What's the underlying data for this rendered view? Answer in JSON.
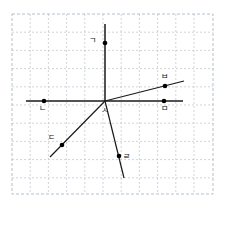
{
  "figure": {
    "background_color": "#ffffff",
    "grid": {
      "show": true,
      "border_color": "#9fb0c0",
      "line_color": "#b9c4cf",
      "style": "dashed",
      "x_start": 12,
      "y_start": 14,
      "x_end": 213,
      "y_end": 194,
      "spacing": 18.2,
      "columns": 11,
      "rows": 10
    },
    "origin": {
      "name": "origin",
      "x": 105,
      "y": 101
    },
    "axes": {
      "horizontal": {
        "name": "x-axis",
        "x1": 26,
        "y1": 101,
        "x2": 183,
        "y2": 101
      },
      "vertical": {
        "name": "y-axis",
        "x1": 105,
        "y1": 24,
        "x2": 105,
        "y2": 101
      }
    },
    "rays": [
      {
        "name": "ray-to-b",
        "x1": 105,
        "y1": 101,
        "x2": 184,
        "y2": 81
      },
      {
        "name": "ray-to-c",
        "x1": 105,
        "y1": 101,
        "x2": 50,
        "y2": 157
      },
      {
        "name": "ray-to-r",
        "x1": 105,
        "y1": 101,
        "x2": 124,
        "y2": 178
      }
    ],
    "points": [
      {
        "id": "g",
        "label": "ㄱ",
        "x": 105,
        "y": 43,
        "label_x": 96,
        "label_y": 43,
        "label_anchor": "end"
      },
      {
        "id": "n",
        "label": "ㄴ",
        "x": 44,
        "y": 101,
        "label_x": 39,
        "label_y": 111,
        "label_anchor": "start"
      },
      {
        "id": "d",
        "label": "ㄷ",
        "x": 62,
        "y": 145,
        "label_x": 55,
        "label_y": 140,
        "label_anchor": "end"
      },
      {
        "id": "r",
        "label": "ㄹ",
        "x": 119,
        "y": 156,
        "label_x": 123,
        "label_y": 159,
        "label_anchor": "start"
      },
      {
        "id": "m",
        "label": "ㅁ",
        "x": 164,
        "y": 101,
        "label_x": 164,
        "label_y": 111,
        "label_anchor": "middle"
      },
      {
        "id": "b",
        "label": "ㅂ",
        "x": 165,
        "y": 86,
        "label_x": 164,
        "label_y": 79,
        "label_anchor": "middle"
      },
      {
        "id": "s",
        "label": "ㅅ",
        "x": 105,
        "y": 101,
        "label_x": 104,
        "label_y": 113,
        "label_anchor": "middle"
      }
    ],
    "point_radius": 2.3,
    "colors": {
      "ink": "#1a1a1a",
      "grid": "#b9c4cf",
      "grid_border": "#9fb0c0",
      "point": "#000000"
    }
  }
}
